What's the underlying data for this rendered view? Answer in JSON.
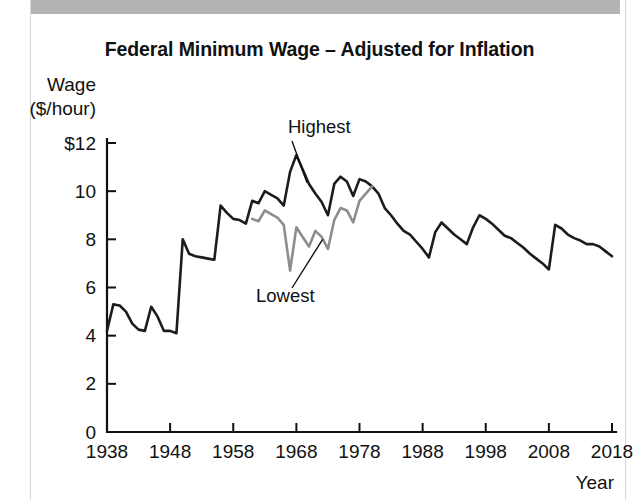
{
  "page": {
    "top_band_fragment": "",
    "frame_color": "#d8d8d8",
    "band_color": "#b4b4b4"
  },
  "figure": {
    "title": "Federal Minimum Wage – Adjusted for Inflation"
  },
  "axes": {
    "y_title_line1": "Wage",
    "y_title_line2": "($/hour)",
    "x_title": "Year",
    "y_ticks": [
      "0",
      "2",
      "4",
      "6",
      "8",
      "10",
      "$12"
    ],
    "x_ticks": [
      "1938",
      "1948",
      "1958",
      "1968",
      "1978",
      "1988",
      "1998",
      "2008",
      "2018"
    ]
  },
  "annotations": {
    "highest": "Highest",
    "lowest": "Lowest"
  },
  "chart_data": {
    "type": "line",
    "title": "Federal Minimum Wage – Adjusted for Inflation",
    "xlabel": "Year",
    "ylabel": "Wage ($/hour)",
    "xlim": [
      1938,
      2018
    ],
    "ylim": [
      0,
      12
    ],
    "ytick_values": [
      0,
      2,
      4,
      6,
      8,
      10,
      12
    ],
    "ytick_labels": [
      "0",
      "2",
      "4",
      "6",
      "8",
      "10",
      "$12"
    ],
    "xtick_values": [
      1938,
      1948,
      1958,
      1968,
      1978,
      1988,
      1998,
      2008,
      2018
    ],
    "grid": false,
    "legend": "inline annotations",
    "annotations": [
      {
        "text": "Highest",
        "points_to_year": 1968,
        "points_to_value": 11.5,
        "series": "Highest"
      },
      {
        "text": "Lowest",
        "points_to_year": 1971,
        "points_to_value": 8.3,
        "series": "Lowest"
      }
    ],
    "series": [
      {
        "name": "Highest",
        "color": "#1c1c1c",
        "x": [
          1938,
          1939,
          1940,
          1941,
          1942,
          1943,
          1944,
          1945,
          1946,
          1947,
          1948,
          1949,
          1950,
          1951,
          1952,
          1953,
          1954,
          1955,
          1956,
          1957,
          1958,
          1959,
          1960,
          1961,
          1962,
          1963,
          1964,
          1965,
          1966,
          1967,
          1968,
          1969,
          1970,
          1971,
          1972,
          1973,
          1974,
          1975,
          1976,
          1977,
          1978,
          1979,
          1980,
          1981,
          1982,
          1983,
          1984,
          1985,
          1986,
          1987,
          1988,
          1989,
          1990,
          1991,
          1992,
          1993,
          1994,
          1995,
          1996,
          1997,
          1998,
          1999,
          2000,
          2001,
          2002,
          2003,
          2004,
          2005,
          2006,
          2007,
          2008,
          2009,
          2010,
          2011,
          2012,
          2013,
          2014,
          2015,
          2016,
          2017,
          2018
        ],
        "y": [
          4.2,
          5.3,
          5.25,
          5.0,
          4.5,
          4.25,
          4.2,
          5.2,
          4.8,
          4.2,
          4.2,
          4.1,
          8.0,
          7.4,
          7.3,
          7.25,
          7.2,
          7.15,
          9.4,
          9.1,
          8.85,
          8.8,
          8.65,
          9.6,
          9.5,
          10.0,
          9.85,
          9.7,
          9.4,
          10.8,
          11.5,
          10.9,
          10.3,
          9.9,
          9.55,
          9.0,
          10.3,
          10.6,
          10.4,
          9.8,
          10.5,
          10.4,
          10.2,
          9.9,
          9.3,
          9.0,
          8.65,
          8.35,
          8.2,
          7.9,
          7.6,
          7.25,
          8.3,
          8.7,
          8.45,
          8.2,
          8.0,
          7.8,
          8.5,
          9.0,
          8.85,
          8.65,
          8.4,
          8.15,
          8.05,
          7.85,
          7.65,
          7.4,
          7.2,
          7.0,
          6.75,
          8.6,
          8.45,
          8.2,
          8.05,
          7.95,
          7.8,
          7.8,
          7.7,
          7.5,
          7.3
        ]
      },
      {
        "name": "Lowest",
        "color": "#8d8d8d",
        "x": [
          1961,
          1962,
          1963,
          1964,
          1965,
          1966,
          1967,
          1968,
          1969,
          1970,
          1971,
          1972,
          1973,
          1974,
          1975,
          1976,
          1977,
          1978,
          1979,
          1980
        ],
        "y": [
          8.85,
          8.75,
          9.2,
          9.05,
          8.9,
          8.6,
          6.7,
          8.5,
          8.1,
          7.7,
          8.35,
          8.1,
          7.6,
          8.8,
          9.3,
          9.2,
          8.7,
          9.6,
          9.9,
          10.2
        ]
      }
    ]
  }
}
